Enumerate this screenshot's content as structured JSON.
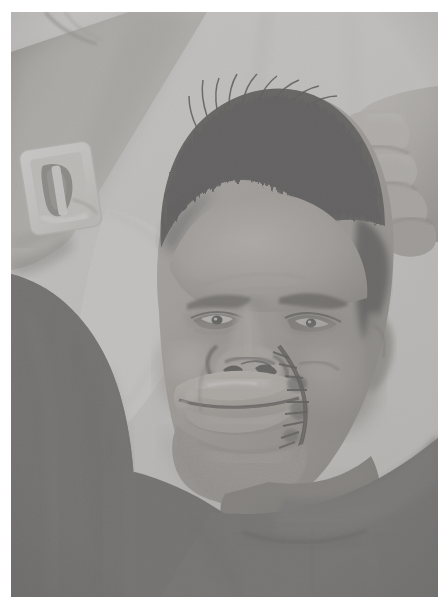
{
  "image": {
    "kind": "clinical-photograph",
    "color_mode": "grayscale",
    "orientation": "portrait",
    "width_px": 441,
    "height_px": 609,
    "border": {
      "color": "#ffffff",
      "left_px": 11,
      "top_px": 12,
      "right_px": 3,
      "bottom_px": 12
    },
    "caption": "",
    "subject": {
      "description": "Adult male patient lying supine on a hospital pillow, head turned slightly, with post-surgical facial reconstruction of the nose, upper lip and right cheek.",
      "pose": "supine, head on pillow, arm raised across upper frame"
    },
    "regions": [
      {
        "name": "pillow-background",
        "label": "Pillow / bed linen",
        "tone": "#e6e6e4",
        "position": "upper right and upper centre"
      },
      {
        "name": "patient-arm",
        "label": "Raised forearm",
        "tone": "#b9b6b1",
        "position": "upper left diagonal"
      },
      {
        "name": "iv-dressing",
        "label": "Adhesive IV cannula dressing on forearm",
        "tone": "#f2f0ec",
        "position": "left, approx x 22-92, y 140-220"
      },
      {
        "name": "hand-fingers",
        "label": "Fingers of hand resting on scalp",
        "tone": "#cfc9c2",
        "position": "upper right, approx x 330-425, y 95-215"
      },
      {
        "name": "scalp-hair",
        "label": "Short dark cropped hair",
        "tone": "#2f2c29",
        "position": "top centre-right of head"
      },
      {
        "name": "forehead",
        "label": "Forehead",
        "tone": "#a9a49e",
        "position": "centre, below hairline"
      },
      {
        "name": "eyes",
        "label": "Both eyes, partially open, periorbital swelling",
        "tone": "#3b3733",
        "position": "centre, approx y 240-280"
      },
      {
        "name": "nose",
        "label": "Reconstructed nose with nostril margins and crusting",
        "tone": "#8c857e",
        "position": "centre, approx y 290-345"
      },
      {
        "name": "lips",
        "label": "Swollen oedematous lips",
        "tone": "#b2aaa2",
        "position": "centre-low, approx y 340-400"
      },
      {
        "name": "suture-line",
        "label": "Dark suture line from right nasal ala down to the commissure and chin",
        "tone": "#272320",
        "position": "right of midline, approx x 255-300, y 300-430"
      },
      {
        "name": "cheek-right",
        "label": "Right cheek flap with healing margin",
        "tone": "#98918a",
        "position": "right of face"
      },
      {
        "name": "chin-jaw",
        "label": "Chin and jawline with stubble",
        "tone": "#7d7670",
        "position": "lower centre, approx y 420-480"
      },
      {
        "name": "neck",
        "label": "Neck",
        "tone": "#6e6762",
        "position": "lower right of face"
      },
      {
        "name": "garment",
        "label": "Dark grey hospital gown / t-shirt with fabric folds",
        "tone": "#4a4745",
        "position": "lower half of frame"
      },
      {
        "name": "shoulder-right",
        "label": "Right shoulder under garment",
        "tone": "#565351",
        "position": "lower right"
      }
    ],
    "palette": {
      "highlight": "#f4f2ef",
      "light": "#d8d4cf",
      "midtone": "#9a938c",
      "shadow": "#4a4745",
      "deep_shadow": "#232120",
      "border": "#ffffff"
    }
  }
}
